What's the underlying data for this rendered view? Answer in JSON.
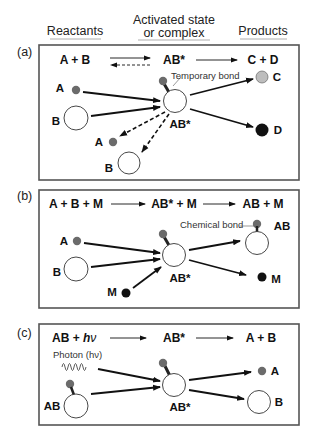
{
  "headers": {
    "reactants": "Reactants",
    "activated_line1": "Activated state",
    "activated_line2": "or complex",
    "products": "Products"
  },
  "colors": {
    "atom_a": "#6b6b6b",
    "atom_c": "#bdbdbd",
    "atom_d": "#111111",
    "atom_m": "#111111",
    "box_border": "#555555",
    "arrow": "#111111"
  },
  "panels": [
    {
      "id": "a",
      "label": "(a)",
      "equation": {
        "reactants": "A + B",
        "intermediate": "AB*",
        "products": "C + D"
      },
      "labels": {
        "a_in": "A",
        "b_in": "B",
        "complex": "AB*",
        "c_out": "C",
        "d_out": "D",
        "a_back": "A",
        "b_back": "B"
      },
      "annotation": "Temporary bond"
    },
    {
      "id": "b",
      "label": "(b)",
      "equation": {
        "reactants": "A + B + M",
        "intermediate": "AB* + M",
        "products": "AB + M"
      },
      "labels": {
        "a_in": "A",
        "b_in": "B",
        "m_in": "M",
        "complex": "AB*",
        "ab_out": "AB",
        "m_out": "M"
      },
      "annotation": "Chemical bond"
    },
    {
      "id": "c",
      "label": "(c)",
      "equation": {
        "reactants_main": "AB + ",
        "reactants_h": "h",
        "reactants_nu": "ν",
        "intermediate": "AB*",
        "products": "A + B"
      },
      "labels": {
        "ab_in": "AB",
        "complex": "AB*",
        "a_out": "A",
        "b_out": "B"
      },
      "annotation": "Photon (hν)"
    }
  ]
}
